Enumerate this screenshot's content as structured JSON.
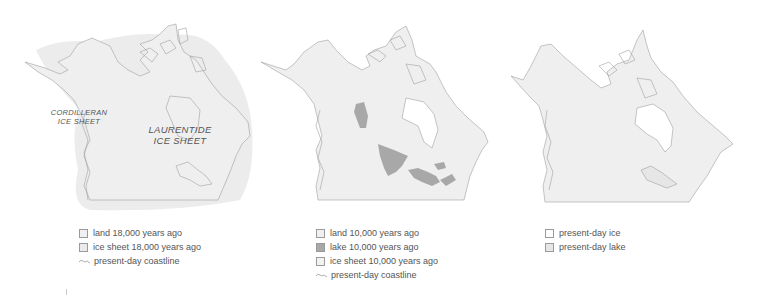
{
  "colors": {
    "land": "#f0f0f0",
    "ice_sheet": "#ebebeb",
    "lake": "#a8a8a8",
    "coastline": "#a0a0a0",
    "present_ice": "#ffffff",
    "present_lake": "#e6e6e6"
  },
  "panels": [
    {
      "map_labels": {
        "cordilleran_line1": "CORDILLERAN",
        "cordilleran_line2": "ICE SHEET",
        "laurentide_line1": "LAURENTIDE",
        "laurentide_line2": "ICE SHEET"
      },
      "legend": [
        {
          "icon": "land-swatch",
          "label": "land 18,000 years ago"
        },
        {
          "icon": "ice-sheet-swatch",
          "label": "ice sheet 18,000 years ago"
        },
        {
          "icon": "coastline-icon",
          "label": "present-day coastline"
        }
      ]
    },
    {
      "legend": [
        {
          "icon": "land-swatch",
          "label": "land 10,000 years ago"
        },
        {
          "icon": "lake-swatch",
          "label": "lake 10,000 years ago"
        },
        {
          "icon": "ice-sheet-swatch",
          "label": "ice sheet 10,000 years ago"
        },
        {
          "icon": "coastline-icon",
          "label": "present-day coastline"
        }
      ]
    },
    {
      "legend": [
        {
          "icon": "ice-swatch",
          "label": "present-day ice"
        },
        {
          "icon": "lake-swatch",
          "label": "present-day lake"
        }
      ]
    }
  ]
}
